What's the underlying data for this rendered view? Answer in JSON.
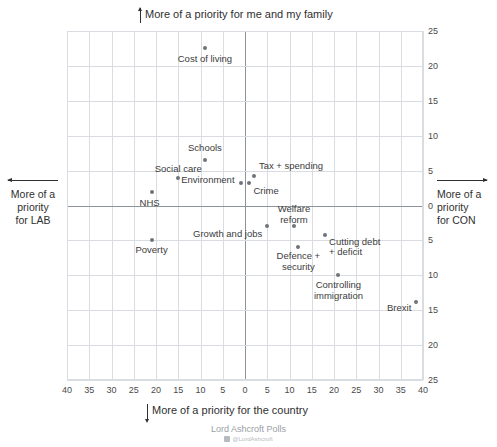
{
  "captions": {
    "top": "More of a priority for me and my family",
    "bottom": "More of a priority for the country",
    "left": "More of a\npriority\nfor LAB",
    "right": "More of a\npriority\nfor CON"
  },
  "credit": {
    "source": "Lord Ashcroft Polls",
    "handle": "@LordAshcroft"
  },
  "chart_data": {
    "type": "scatter",
    "title": "",
    "xlabel": "More of a priority for the country",
    "ylabel": "More of a priority for me and my family",
    "xlim": [
      -40,
      40
    ],
    "ylim": [
      -25,
      25
    ],
    "grid": true,
    "legend": "none",
    "x_tick_labels": [
      "40",
      "35",
      "30",
      "25",
      "20",
      "15",
      "10",
      "5",
      "0",
      "5",
      "10",
      "15",
      "20",
      "25",
      "30",
      "35",
      "40"
    ],
    "x_tick_values": [
      -40,
      -35,
      -30,
      -25,
      -20,
      -15,
      -10,
      -5,
      0,
      5,
      10,
      15,
      20,
      25,
      30,
      35,
      40
    ],
    "y_tick_labels": [
      "25",
      "20",
      "15",
      "10",
      "5",
      "0",
      "5",
      "10",
      "15",
      "20",
      "25"
    ],
    "y_tick_values": [
      25,
      20,
      15,
      10,
      5,
      0,
      -5,
      -10,
      -15,
      -20,
      -25
    ],
    "axis_note_left": "More of a priority for LAB",
    "axis_note_right": "More of a priority for CON",
    "points": [
      {
        "label": "Cost of living",
        "x": -9,
        "y": 22.5,
        "label_pos": "below"
      },
      {
        "label": "Schools",
        "x": -9,
        "y": 6.5,
        "label_pos": "above"
      },
      {
        "label": "Social care",
        "x": -15,
        "y": 4,
        "label_pos": "above"
      },
      {
        "label": "NHS",
        "x": -21,
        "y": 2,
        "label_pos": "below"
      },
      {
        "label": "Environment",
        "x": -1,
        "y": 3.2,
        "label_pos": "left"
      },
      {
        "label": "Tax + spending",
        "x": 2,
        "y": 4.2,
        "label_pos": "above-right"
      },
      {
        "label": "Crime",
        "x": 1,
        "y": 3.2,
        "label_pos": "below-right"
      },
      {
        "label": "Welfare reform",
        "x": 11,
        "y": -3,
        "label_pos": "above"
      },
      {
        "label": "Growth and jobs",
        "x": 5,
        "y": -3,
        "label_pos": "below-left"
      },
      {
        "label": "Poverty",
        "x": -21,
        "y": -5,
        "label_pos": "below"
      },
      {
        "label": "Cutting debt + deficit",
        "x": 18,
        "y": -4.2,
        "label_pos": "below-right"
      },
      {
        "label": "Defence + security",
        "x": 12,
        "y": -6,
        "label_pos": "below"
      },
      {
        "label": "Controlling immigration",
        "x": 21,
        "y": -10,
        "label_pos": "below"
      },
      {
        "label": "Brexit",
        "x": 38.5,
        "y": -13.8,
        "label_pos": "left"
      }
    ]
  },
  "colors": {
    "point": "#6e7479",
    "grid": "#d9dde2",
    "axis": "#8d9398",
    "text": "#3b3b3b",
    "credit": "#9aa0a6"
  }
}
